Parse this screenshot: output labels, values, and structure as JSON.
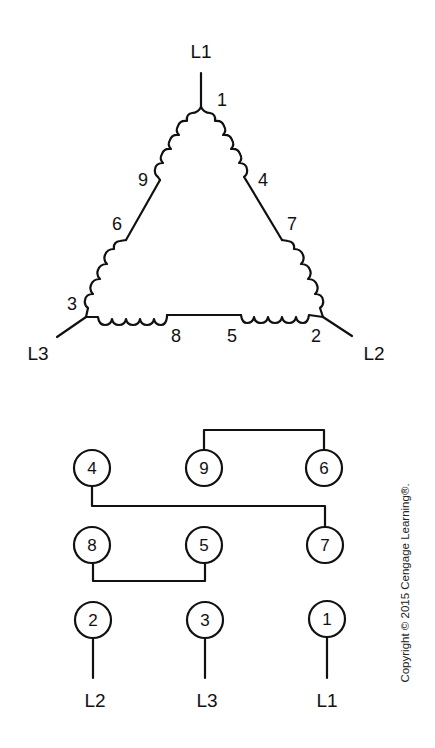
{
  "delta_diagram": {
    "line_labels": {
      "top": "L1",
      "left": "L3",
      "right": "L2"
    },
    "lead_labels": {
      "t1": "1",
      "t4": "4",
      "t7": "7",
      "t2": "2",
      "t5": "5",
      "t8": "8",
      "t3": "3",
      "t6": "6",
      "t9": "9"
    }
  },
  "terminal_board": {
    "rows": [
      {
        "terminals": [
          "4",
          "9",
          "6"
        ]
      },
      {
        "terminals": [
          "8",
          "5",
          "7"
        ]
      },
      {
        "terminals": [
          "2",
          "3",
          "1"
        ]
      }
    ],
    "line_labels": [
      "L2",
      "L3",
      "L1"
    ],
    "connections": [
      {
        "from": "9",
        "to": "6"
      },
      {
        "from": "4",
        "to": "7"
      },
      {
        "from": "8",
        "to": "5"
      }
    ]
  },
  "copyright": "Copyright © 2015 Cengage Learning®."
}
